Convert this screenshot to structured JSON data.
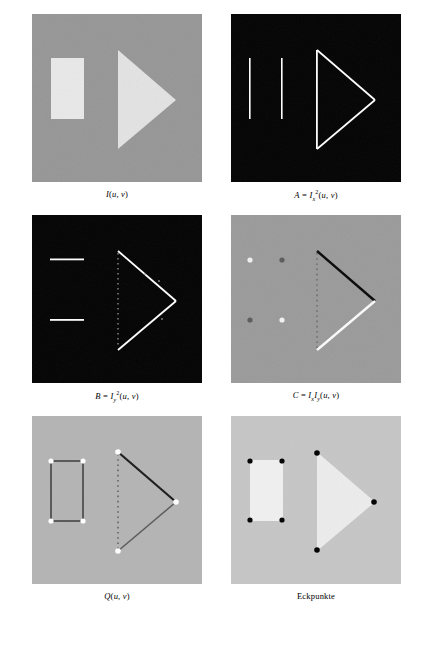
{
  "figure": {
    "panels": [
      {
        "id": "panel-original",
        "caption_html": "I(u, v)",
        "caption_text": "I(u,v)",
        "background": "#969696",
        "shape_color": "#e8e8e8",
        "description": "original grayscale image with bright rectangle and bright triangle on gray background"
      },
      {
        "id": "panel-ix2",
        "caption_html": "A = I_x^2(u, v)",
        "caption_text": "A = Ix2(u,v)",
        "background": "#050505",
        "shape_color": "#ffffff",
        "description": "squared horizontal derivative: vertical edges bright"
      },
      {
        "id": "panel-iy2",
        "caption_html": "B = I_y^2(u, v)",
        "caption_text": "B = Iy2(u,v)",
        "background": "#050505",
        "shape_color": "#ffffff",
        "description": "squared vertical derivative: horizontal edges bright"
      },
      {
        "id": "panel-ixiy",
        "caption_html": "C = I_x I_y(u, v)",
        "caption_text": "C = Ix Iy(u,v)",
        "background": "#9a9a9a",
        "shape_color_positive": "#ffffff",
        "shape_color_negative": "#000000",
        "description": "product of derivatives, signed: bright and dark diagonal edges"
      },
      {
        "id": "panel-q",
        "caption_html": "Q(u, v)",
        "caption_text": "Q(u,v)",
        "background": "#b4b4b4",
        "shape_color_positive": "#ffffff",
        "shape_color_negative": "#111111",
        "description": "corner response function with bright dots at corners"
      },
      {
        "id": "panel-corners",
        "caption_html": "Eckpunkte",
        "caption_text": "Eckpunkte",
        "background": "#c8c8c8",
        "shape_color": "#f0f0f0",
        "marker_color": "#000000",
        "description": "detected corner points marked as black dots on the shapes"
      }
    ],
    "bottom_caption": ""
  }
}
